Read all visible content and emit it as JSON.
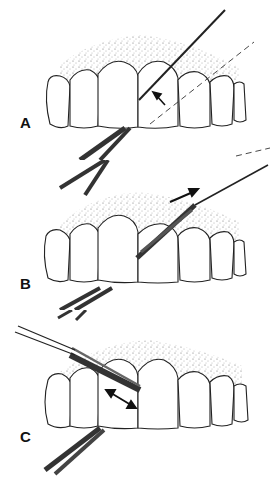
{
  "figure": {
    "panels": [
      {
        "label": "A",
        "description": "Threaded floss with stiff end inserted between central incisors; arrow points at contact area; dashed line shows path"
      },
      {
        "label": "B",
        "description": "Floss pulled through interproximal space in direction of arrow"
      },
      {
        "label": "C",
        "description": "Floss wrapped against tooth surface, moved back and forth as shown by double-headed arrow"
      }
    ]
  },
  "colors": {
    "ink": "#1a1a1a",
    "gum_stipple": "#555555",
    "background": "#ffffff"
  }
}
